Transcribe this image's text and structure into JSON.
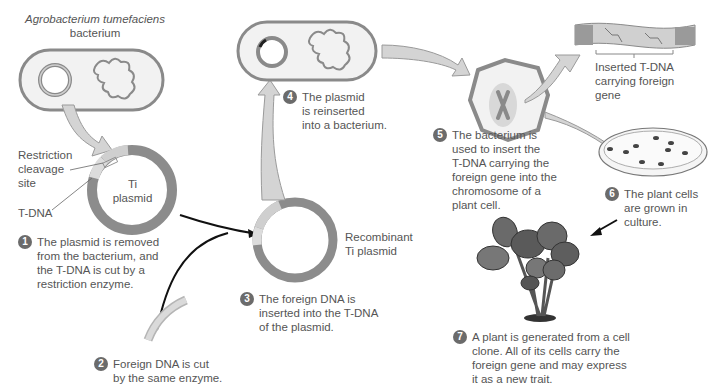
{
  "colors": {
    "membrane": "#8a8a8a",
    "cell_fill": "#f2f2f2",
    "plasmid_dark": "#8c8c8c",
    "plasmid_light": "#cfcfcf",
    "arrow_fill": "#d4d4d4",
    "badge": "#6b6b6b",
    "text": "#555555"
  },
  "labels": {
    "bacterium_species": "Agrobacterium tumefaciens",
    "bacterium": "bacterium",
    "restriction_site": "Restriction\ncleavage\nsite",
    "t_dna": "T-DNA",
    "ti_plasmid": "Ti\nplasmid",
    "recombinant_plasmid": "Recombinant\nTi plasmid",
    "inserted_tdna": "Inserted T-DNA\ncarrying foreign\ngene"
  },
  "steps": [
    {
      "num": "1",
      "text": "The plasmid is removed\nfrom the bacterium, and\nthe T-DNA is cut by a\nrestriction enzyme."
    },
    {
      "num": "2",
      "text": "Foreign DNA is cut\nby the same enzyme."
    },
    {
      "num": "3",
      "text": "The foreign DNA is\ninserted into the T-DNA\nof the plasmid."
    },
    {
      "num": "4",
      "text": "The plasmid\nis reinserted\ninto a bacterium."
    },
    {
      "num": "5",
      "text": "The bacterium is\nused to insert the\nT-DNA carrying the\nforeign gene into the\nchromosome of a\nplant cell."
    },
    {
      "num": "6",
      "text": "The plant cells\nare grown in\nculture."
    },
    {
      "num": "7",
      "text": "A plant is generated from a cell\nclone. All of its cells carry the\nforeign gene and may express\nit as a new trait."
    }
  ]
}
